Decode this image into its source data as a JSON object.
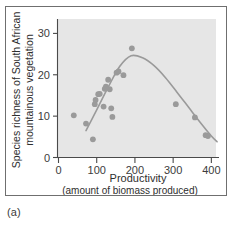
{
  "figure": {
    "caption": "(a)",
    "panel_border_color": "#6f6f6f",
    "plot_background_color": "#e6e6e6",
    "point_color": "#9a9a9a",
    "curve_color": "#9a9a9a",
    "axis_color": "#4a4a4a"
  },
  "chart_data": {
    "type": "scatter",
    "title": "",
    "subtitle": "",
    "xlabel": "Productivity",
    "xlabel_sub": "(amount of biomass produced)",
    "ylabel": "Species richness of South African mountainous vegetation",
    "ylabel_line1": "Species richness of South African",
    "ylabel_line2": "mountainous vegetation",
    "xlim": [
      0,
      420
    ],
    "ylim": [
      0,
      33
    ],
    "xticks": [
      0,
      100,
      200,
      300,
      400
    ],
    "yticks": [
      0,
      10,
      20,
      30
    ],
    "xtick_labels": [
      "0",
      "100",
      "200",
      "300",
      "400"
    ],
    "ytick_labels": [
      "0",
      "10",
      "20",
      "30"
    ],
    "grid": false,
    "legend": false,
    "legend_position": "none",
    "annotations": [],
    "points": [
      {
        "x": 40,
        "y": 10.2
      },
      {
        "x": 72,
        "y": 8.2
      },
      {
        "x": 90,
        "y": 4.4
      },
      {
        "x": 95,
        "y": 12.9
      },
      {
        "x": 97,
        "y": 13.9
      },
      {
        "x": 104,
        "y": 15.3
      },
      {
        "x": 108,
        "y": 15.4
      },
      {
        "x": 118,
        "y": 12.3
      },
      {
        "x": 121,
        "y": 16.6
      },
      {
        "x": 124,
        "y": 17.1
      },
      {
        "x": 130,
        "y": 18.8
      },
      {
        "x": 134,
        "y": 16.5
      },
      {
        "x": 138,
        "y": 11.9
      },
      {
        "x": 141,
        "y": 9.8
      },
      {
        "x": 152,
        "y": 20.5
      },
      {
        "x": 157,
        "y": 20.8
      },
      {
        "x": 170,
        "y": 19.9
      },
      {
        "x": 192,
        "y": 26.4
      },
      {
        "x": 307,
        "y": 12.9
      },
      {
        "x": 357,
        "y": 9.7
      },
      {
        "x": 385,
        "y": 5.4
      },
      {
        "x": 391,
        "y": 5.2
      }
    ],
    "fit_curve": {
      "name": "hump-shaped fit",
      "description": "unimodal curve rising to a peak near productivity 190 then declining",
      "x": [
        72,
        100,
        130,
        160,
        190,
        220,
        250,
        280,
        310,
        340,
        370,
        400,
        415
      ],
      "y": [
        6.5,
        11.5,
        17.0,
        22.0,
        24.6,
        24.1,
        22.2,
        19.3,
        15.8,
        12.2,
        8.6,
        5.2,
        3.8
      ]
    }
  }
}
